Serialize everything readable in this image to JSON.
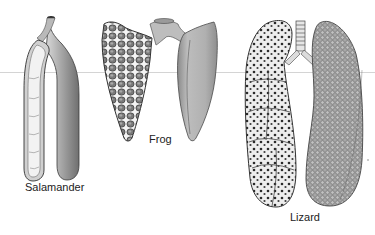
{
  "figure": {
    "specimens": [
      {
        "id": "salamander",
        "label": "Salamander",
        "description": "Simple sac-like paired lungs; left lung sectioned showing smooth interior with few septa"
      },
      {
        "id": "frog",
        "label": "Frog",
        "description": "Paired lungs with short trachea; left lung sectioned showing honeycomb septa"
      },
      {
        "id": "lizard",
        "label": "Lizard",
        "description": "Paired elongated lungs with ringed trachea and bronchi; left lung sectioned showing multi-chambered faveoli, right lung outer surface with alveolar texture"
      }
    ]
  },
  "labels": {
    "salamander": "Salamander",
    "frog": "Frog",
    "lizard": "Lizard"
  },
  "colors": {
    "background": "#ffffff",
    "ink": "#222222",
    "lung_shade_dark": "#6e6e6e",
    "lung_shade_mid": "#a4a4a4",
    "lung_shade_light": "#d6d6d6",
    "section_interior": "#ececec"
  }
}
